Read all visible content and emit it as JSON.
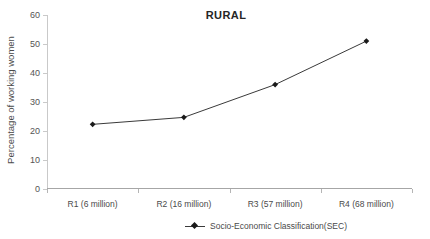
{
  "chart_data": {
    "type": "line",
    "title": "RURAL",
    "xlabel": "",
    "ylabel": "Percentage of working women",
    "categories": [
      "R1 (6 million)",
      "R2 (16 million)",
      "R3 (57 million)",
      "R4 (68 million)"
    ],
    "series": [
      {
        "name": "Socio-Economic Classification(SEC)",
        "values": [
          22.3,
          24.7,
          36.0,
          51.0
        ]
      }
    ],
    "ylim": [
      0,
      60
    ],
    "yticks": [
      0,
      10,
      20,
      30,
      40,
      50,
      60
    ],
    "ytick_labels": [
      "0",
      "10",
      "20",
      "30",
      "40",
      "50",
      "60"
    ],
    "grid": false,
    "legend_position": "bottom",
    "marker": "diamond",
    "line_color": "#3a3a3a",
    "marker_color": "#1a1a1a",
    "axis_color": "#b5b5b5",
    "text_color": "#4a4a4a"
  }
}
